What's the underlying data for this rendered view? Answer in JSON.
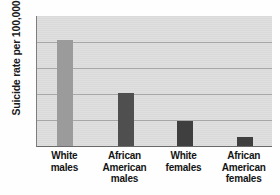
{
  "chart_data": {
    "type": "bar",
    "title": "",
    "subtitle": "",
    "xlabel": "",
    "ylabel": "Suicide rate per 100,000",
    "categories": [
      "White males",
      "African American males",
      "White females",
      "African American females"
    ],
    "category_lines": [
      [
        "White",
        "males"
      ],
      [
        "African",
        "American",
        "males"
      ],
      [
        "White",
        "females"
      ],
      [
        "African",
        "American",
        "females"
      ]
    ],
    "values": [
      20.3,
      10.2,
      4.7,
      1.7
    ],
    "ylim": [
      0,
      25
    ],
    "yticks": [
      5,
      10,
      15,
      20,
      25
    ],
    "ytick_labels": [
      "5",
      "10",
      "15",
      "20",
      "25"
    ],
    "grid": true,
    "grid_orientation": "horizontal",
    "legend": false,
    "legend_position": "none",
    "bar_colors": [
      "#9b9b9b",
      "#4f4f4f",
      "#3f3f3f",
      "#3f3f3f"
    ],
    "plot_background": "#dddddd",
    "gridline_color": "#a9a9a9",
    "axis_color": "#6a6a6a",
    "annotations": []
  }
}
